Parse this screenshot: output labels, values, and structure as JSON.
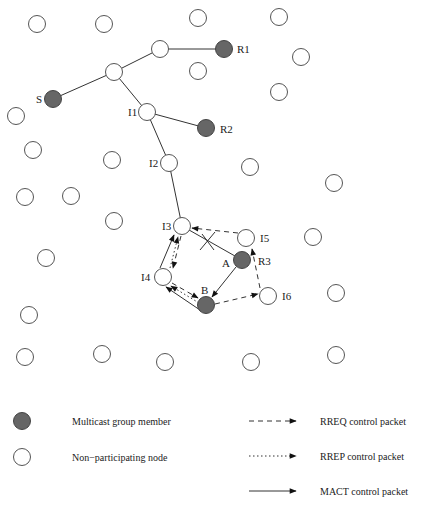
{
  "diagram": {
    "colors": {
      "member_fill": "#666666",
      "empty_fill": "#ffffff",
      "stroke": "#333333"
    },
    "node_labels": {
      "S": "S",
      "R1": "R1",
      "R2": "R2",
      "R3": "R3",
      "I1": "I1",
      "I2": "I2",
      "I3": "I3",
      "I4": "I4",
      "I5": "I5",
      "I6": "I6",
      "A": "A",
      "B": "B"
    },
    "nodes": [
      {
        "id": "S",
        "type": "member"
      },
      {
        "id": "R1",
        "type": "member"
      },
      {
        "id": "R2",
        "type": "member"
      },
      {
        "id": "R3",
        "type": "member",
        "alias": "A"
      },
      {
        "id": "B",
        "type": "member"
      },
      {
        "id": "I1",
        "type": "empty"
      },
      {
        "id": "I2",
        "type": "empty"
      },
      {
        "id": "I3",
        "type": "empty"
      },
      {
        "id": "I4",
        "type": "empty"
      },
      {
        "id": "I5",
        "type": "empty"
      },
      {
        "id": "I6",
        "type": "empty"
      }
    ],
    "tree_edges": [
      [
        "S",
        "T1"
      ],
      [
        "T1",
        "T2"
      ],
      [
        "T2",
        "R1"
      ],
      [
        "T1",
        "I1"
      ],
      [
        "I1",
        "R2"
      ],
      [
        "I1",
        "I2"
      ],
      [
        "I2",
        "I3"
      ]
    ],
    "broken_link": [
      "I3",
      "A"
    ],
    "rreq_edges": [
      [
        "I5",
        "I3"
      ],
      [
        "I6",
        "I5"
      ],
      [
        "B",
        "I6"
      ],
      [
        "I3",
        "I4"
      ],
      [
        "I4",
        "B"
      ]
    ],
    "rrep_edges": [
      [
        "I4",
        "I3"
      ],
      [
        "B",
        "I4"
      ]
    ],
    "mact_edges": [
      [
        "A",
        "B"
      ],
      [
        "B",
        "I4"
      ],
      [
        "I4",
        "I3"
      ]
    ]
  },
  "legend": {
    "member_label": "Multicast group member",
    "empty_label": "Non−participating node",
    "rreq_label": "RREQ control packet",
    "rrep_label": "RREP control packet",
    "mact_label": "MACT control packet"
  }
}
